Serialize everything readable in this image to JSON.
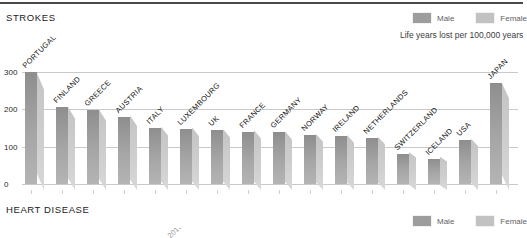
{
  "sections": {
    "strokes": {
      "title": "STROKES"
    },
    "heart": {
      "title": "HEART DISEASE"
    }
  },
  "legend": {
    "male_label": "Male",
    "female_label": "Female",
    "male_color": "#9d9d9d",
    "female_color": "#c2c2c2"
  },
  "subtitle": "Life years lost per 100,000 years",
  "chart_data": {
    "type": "bar",
    "title": "STROKES",
    "subtitle": "Life years lost per 100,000 years",
    "xlabel": "",
    "ylabel": "",
    "ylim": [
      0,
      320
    ],
    "yticks": [
      0,
      100,
      200,
      300
    ],
    "ytick_labels": [
      "0",
      "100",
      "200",
      "300"
    ],
    "grid": true,
    "legend_position": "top-right",
    "categories": [
      "PORTUGAL",
      "FINLAND",
      "GREECE",
      "AUSTRIA",
      "ITALY",
      "LUXEMBOURG",
      "UK",
      "FRANCE",
      "GERMANY",
      "NORWAY",
      "IRELAND",
      "NETHERLANDS",
      "SWITZERLAND",
      "ICELAND",
      "USA",
      "JAPAN"
    ],
    "series": [
      {
        "name": "Male",
        "color": "#9d9d9d",
        "values": [
          300,
          205,
          198,
          180,
          150,
          148,
          143,
          140,
          138,
          130,
          128,
          122,
          80,
          68,
          118,
          270
        ]
      },
      {
        "name": "Female",
        "color": "#c2c2c2",
        "values": [
          285,
          195,
          188,
          172,
          142,
          140,
          136,
          133,
          130,
          123,
          120,
          115,
          74,
          62,
          110,
          258
        ]
      }
    ]
  },
  "heart_stub_labels": [
    "2019",
    "",
    ""
  ]
}
